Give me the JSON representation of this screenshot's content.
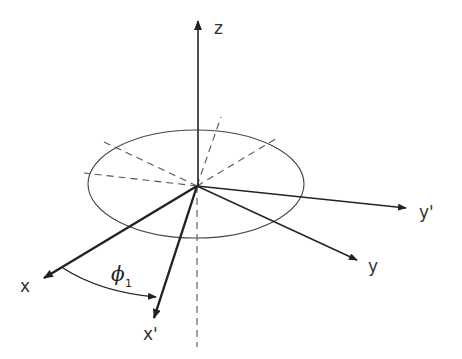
{
  "diagram": {
    "axes": {
      "z": {
        "label": "z"
      },
      "x": {
        "label": "x"
      },
      "y": {
        "label": "y"
      },
      "x_prime": {
        "label": "x'"
      },
      "y_prime": {
        "label": "y'"
      }
    },
    "angle": {
      "symbol": "ϕ",
      "subscript": "1"
    },
    "colors": {
      "line": "#222222",
      "dashed": "#555555",
      "background": "#ffffff"
    }
  }
}
